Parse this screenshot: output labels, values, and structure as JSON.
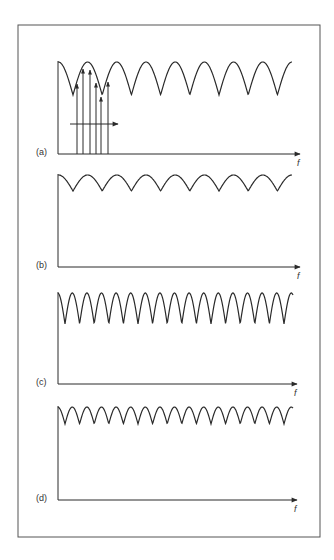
{
  "figure": {
    "frame": {
      "x": 18,
      "y": 25,
      "width": 302,
      "height": 512,
      "stroke": "#555555"
    },
    "line_color": "#2a2a2a",
    "axis_x_label": "f"
  },
  "panels": [
    {
      "id": "a",
      "label": "(a)",
      "axis_y": 154,
      "wave_top": 62,
      "wave_bottom": 95,
      "period": 29.2,
      "phase_dip": 73,
      "x_start": 58,
      "x_end": 292,
      "arrow_tip": 300,
      "carriers": [
        {
          "x": 77,
          "tip": 84
        },
        {
          "x": 83,
          "tip": 69
        },
        {
          "x": 90,
          "tip": 70
        },
        {
          "x": 96,
          "tip": 83
        },
        {
          "x": 101,
          "tip": 97
        },
        {
          "x": 108,
          "tip": 82
        }
      ],
      "sweep_arrow": {
        "y": 124,
        "x1": 70,
        "x2": 118
      }
    },
    {
      "id": "b",
      "label": "(b)",
      "axis_y": 267,
      "wave_top": 175,
      "wave_bottom": 191,
      "period": 29.2,
      "phase_dip": 73,
      "x_start": 58,
      "x_end": 292,
      "arrow_tip": 300
    },
    {
      "id": "c",
      "label": "(c)",
      "axis_y": 384,
      "wave_top": 293,
      "wave_bottom": 324,
      "period": 14.6,
      "phase_dip": 65,
      "x_start": 58,
      "x_end": 293,
      "arrow_tip": 297
    },
    {
      "id": "d",
      "label": "(d)",
      "axis_y": 500,
      "wave_top": 407,
      "wave_bottom": 424,
      "period": 14.6,
      "phase_dip": 65,
      "x_start": 58,
      "x_end": 293,
      "arrow_tip": 297
    }
  ],
  "chart_data": {
    "type": "line",
    "title": "",
    "xlabel": "f",
    "ylabel": "",
    "panels": [
      {
        "label": "(a)",
        "shape": "rectified periodic ripple (large amplitude, long period)",
        "relative_amplitude": 1.0,
        "relative_period": 2,
        "cycles": 8,
        "annotations": "six vertical carrier arrows under the first peaks; horizontal arrow pointing right"
      },
      {
        "label": "(b)",
        "shape": "rectified periodic ripple (small amplitude, long period)",
        "relative_amplitude": 0.5,
        "relative_period": 2,
        "cycles": 8
      },
      {
        "label": "(c)",
        "shape": "rectified periodic ripple (large amplitude, short period)",
        "relative_amplitude": 1.0,
        "relative_period": 1,
        "cycles": 16
      },
      {
        "label": "(d)",
        "shape": "rectified periodic ripple (small amplitude, short period)",
        "relative_amplitude": 0.5,
        "relative_period": 1,
        "cycles": 16
      }
    ],
    "grid": false,
    "legend": "none"
  }
}
